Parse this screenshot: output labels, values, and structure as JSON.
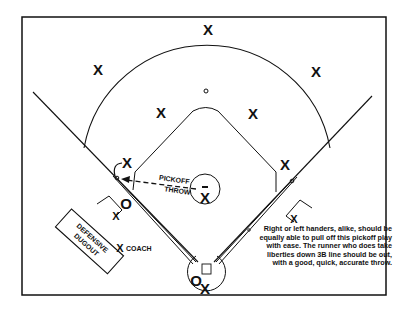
{
  "diagram": {
    "players": {
      "center_fielder": "X",
      "left_fielder": "X",
      "right_fielder": "X",
      "shortstop": "X",
      "second_baseman": "X",
      "third_baseman": "X",
      "first_baseman": "X",
      "pitcher": "X",
      "catcher": "X",
      "third_base_coach": "X",
      "first_base_coach": "X",
      "coach_marker": "X"
    },
    "runners": {
      "runner_third": "O",
      "batter": "O"
    },
    "labels": {
      "throw_line1": "PICKOFF",
      "throw_line2": "THROW",
      "dugout_line1": "DEFENSIVE",
      "dugout_line2": "DUGOUT",
      "coach": "COACH"
    },
    "caption": "Right or left handers, alike, should be equally able to pull off this pickoff play with ease. The runner who does take liberties down 3B line should be out, with a good, quick, accurate throw."
  }
}
